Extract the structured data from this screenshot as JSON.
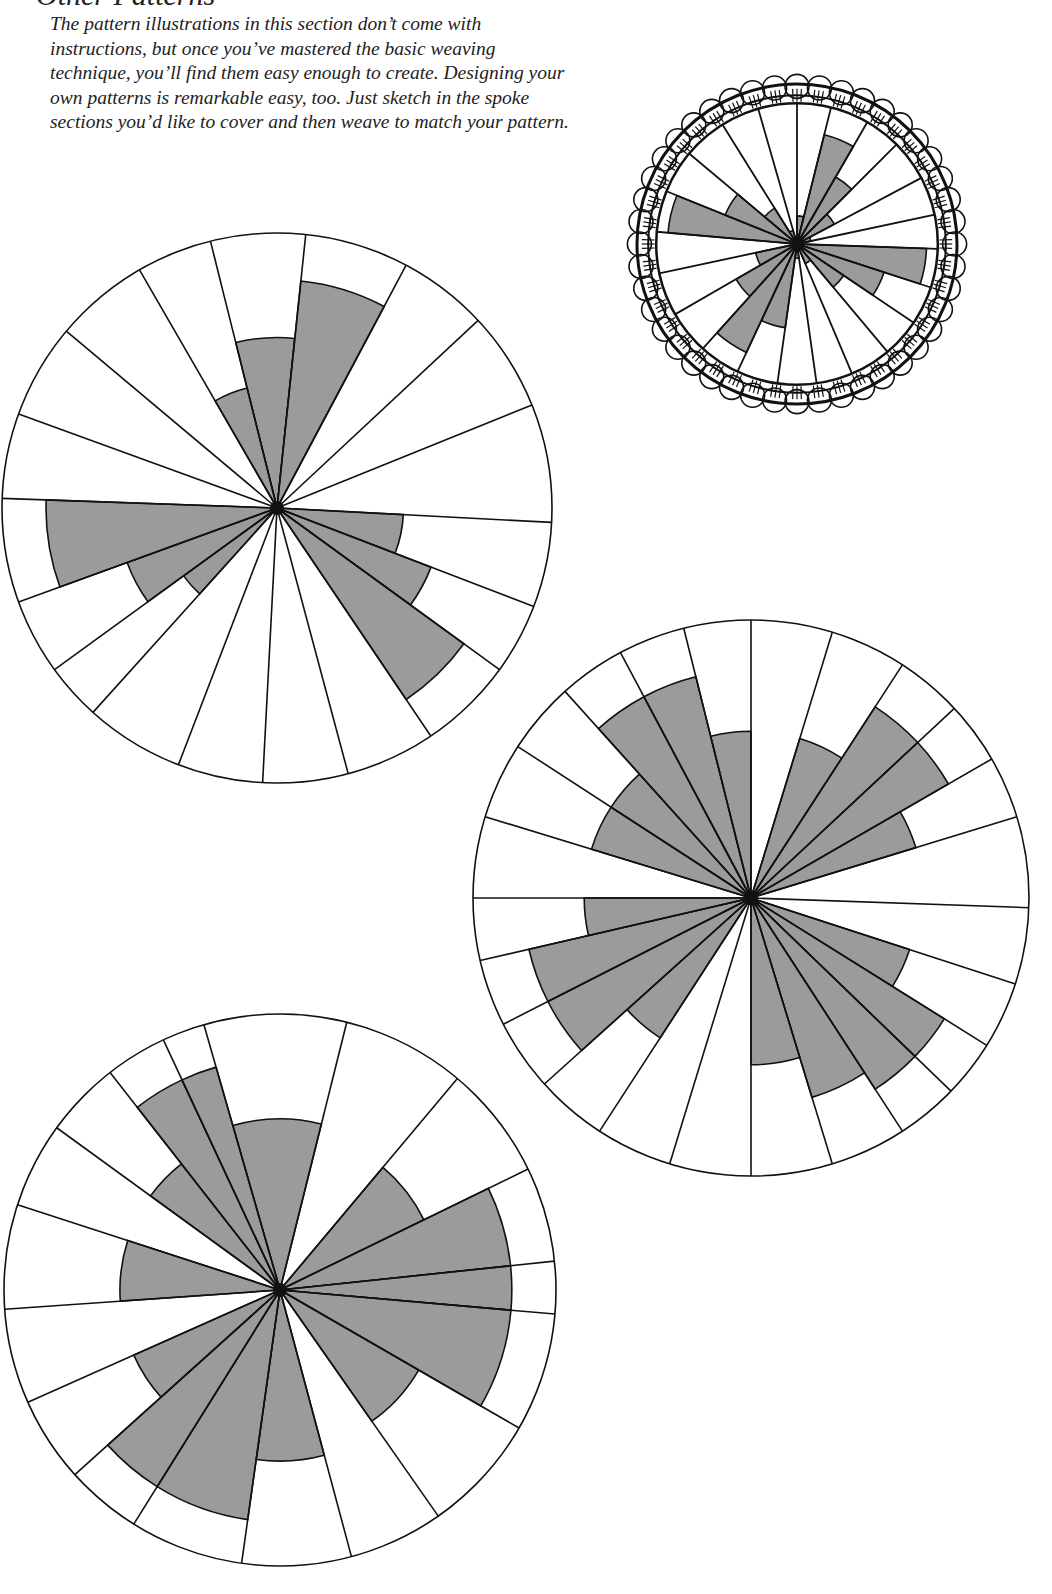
{
  "page": {
    "heading": "• Other Patterns",
    "intro": "The pattern illustrations in this section don’t come with instructions, but once you’ve mastered the basic weaving technique, you’ll find them easy enough to create. Designing your own patterns is remarkable easy, too. Just sketch in the spoke sections you’d like to cover and then weave to match your pattern."
  },
  "colors": {
    "fill": "#9b9b9b",
    "line": "#111111",
    "paper": "#ffffff"
  },
  "wheels": [
    {
      "name": "finished-basket-wheel",
      "cx": 797,
      "cy": 244,
      "r": 160,
      "bordered": true,
      "spokes": [
        0,
        14,
        30,
        45,
        62,
        78,
        92,
        108,
        124,
        140,
        157,
        172,
        188,
        205,
        222,
        240,
        258,
        275,
        292,
        310,
        328,
        344
      ],
      "fills": [
        0.2,
        0.8,
        0.55,
        0.3,
        0.1,
        0,
        0.92,
        0.65,
        0.4,
        0.15,
        0,
        0.1,
        0.6,
        0.85,
        0.5,
        0.3,
        0,
        0.92,
        0.55,
        0.3,
        0.1,
        0
      ]
    },
    {
      "name": "pattern-wheel-1",
      "cx": 277,
      "cy": 508,
      "r": 275,
      "bordered": false,
      "spokes": [
        346,
        6,
        28,
        47,
        68,
        93,
        111,
        126,
        146,
        165,
        183,
        201,
        222,
        234,
        250,
        272,
        290,
        310,
        330
      ],
      "fills": [
        0.62,
        0.83,
        0,
        0,
        0,
        0.46,
        0.6,
        0.84,
        0,
        0,
        0,
        0,
        0.42,
        0.58,
        0.84,
        0,
        0,
        0,
        0.45
      ]
    },
    {
      "name": "pattern-wheel-2",
      "cx": 751,
      "cy": 898,
      "r": 278,
      "bordered": false,
      "spokes": [
        0,
        17,
        33,
        47,
        60,
        73,
        92,
        108,
        122,
        134,
        147,
        163,
        180,
        197,
        213,
        228,
        243,
        257,
        270,
        287,
        303,
        318,
        332,
        346
      ],
      "fills": [
        0,
        0.6,
        0.82,
        0.82,
        0.62,
        0,
        0,
        0.6,
        0.82,
        0.82,
        0.75,
        0.6,
        0,
        0,
        0.6,
        0.82,
        0.82,
        0.6,
        0,
        0.6,
        0.6,
        0.82,
        0.82,
        0.6
      ]
    },
    {
      "name": "pattern-wheel-3",
      "cx": 280,
      "cy": 1290,
      "r": 276,
      "bordered": false,
      "spokes": [
        344,
        14,
        40,
        64,
        84,
        95,
        120,
        145,
        165,
        188,
        212,
        228,
        246,
        266,
        288,
        306,
        322,
        335
      ],
      "fills": [
        0.62,
        0,
        0.58,
        0.84,
        0.84,
        0.84,
        0.58,
        0,
        0.62,
        0.84,
        0.84,
        0.58,
        0,
        0.58,
        0,
        0.58,
        0.84,
        0.84
      ]
    }
  ]
}
